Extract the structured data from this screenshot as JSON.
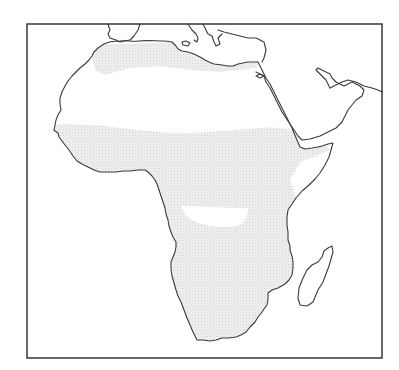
{
  "map": {
    "subject": "Africa and Arabian Peninsula outline map",
    "style": "black coastline outline on white, light grey stippled shading",
    "colors": {
      "background": "#ffffff",
      "coastline": "#3a3a3a",
      "frame": "#2a2a2a",
      "shading": "#d9d9d9"
    },
    "frame": {
      "x": 27,
      "y": 24,
      "width": 355,
      "height": 334
    },
    "regions": [
      {
        "name": "north-african-coastal-band",
        "shaded": true
      },
      {
        "name": "sahara",
        "shaded": false
      },
      {
        "name": "sahel-savanna-band",
        "shaded": true
      },
      {
        "name": "congo-basin",
        "shaded": false
      },
      {
        "name": "horn-of-africa-gap",
        "shaded": false
      },
      {
        "name": "southern-africa",
        "shaded": true
      },
      {
        "name": "madagascar",
        "shaded": false
      },
      {
        "name": "arabian-peninsula",
        "shaded": false
      },
      {
        "name": "iberia-fragment",
        "shaded": false
      },
      {
        "name": "southern-europe-fragment",
        "shaded": false
      }
    ]
  }
}
